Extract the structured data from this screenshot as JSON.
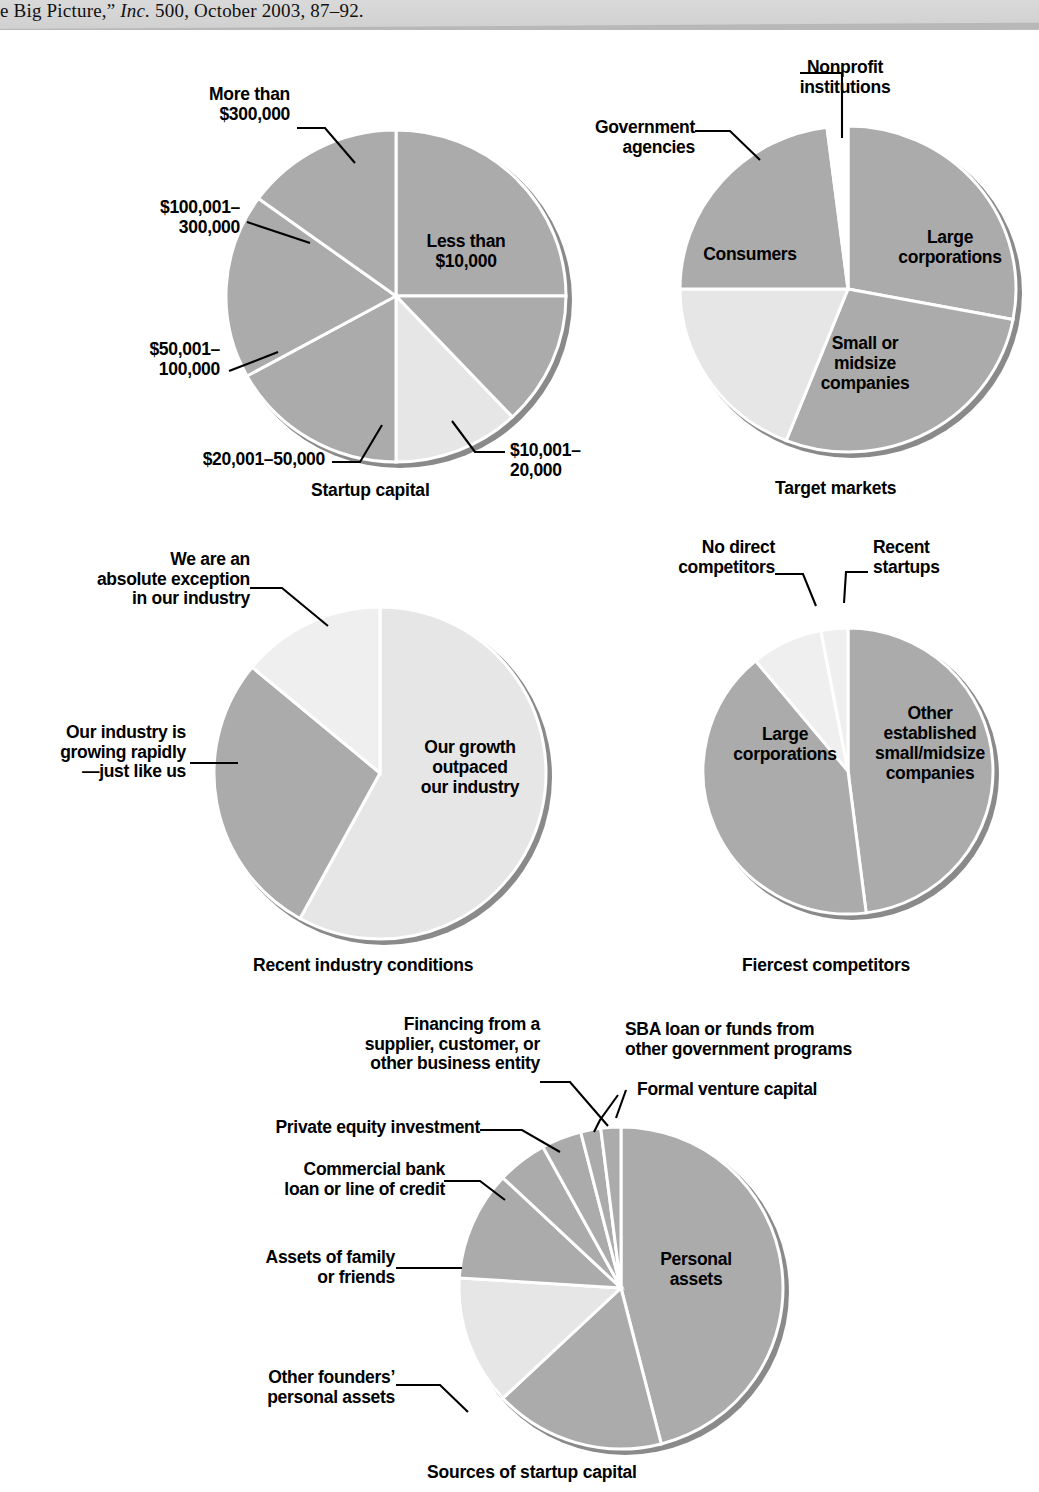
{
  "header": {
    "citation_prefix": "e Big Picture,” ",
    "citation_italic": "Inc.",
    "citation_suffix": " 500, October 2003, 87–92."
  },
  "colors": {
    "slice_mid": "#ababab",
    "slice_light": "#e6e6e6",
    "slice_lighter": "#efefef",
    "slice_dark": "#9d9d9d",
    "edge": "#ffffff",
    "shadow": "#808080",
    "text": "#000000"
  },
  "chart_data": [
    {
      "id": "startup-capital",
      "type": "pie",
      "title": "Startup capital",
      "labels": [
        "Less than\n$10,000",
        "$10,001–\n20,000",
        "$20,001–50,000",
        "$50,001–\n100,000",
        "$100,001–\n300,000",
        "More than\n$300,000"
      ],
      "categories": [
        "Less than $10,000",
        "$10,001–20,000",
        "$20,001–50,000",
        "$50,001–100,000",
        "$100,001–300,000",
        "More than $300,000"
      ],
      "values": [
        25,
        13,
        12,
        17,
        18,
        15
      ],
      "legend": "none",
      "grid": false
    },
    {
      "id": "target-markets",
      "type": "pie",
      "title": "Target markets",
      "labels": [
        "Large\ncorporations",
        "Small or\nmidsize\ncompanies",
        "Consumers",
        "Government\nagencies",
        "Nonprofit\ninstitutions"
      ],
      "categories": [
        "Large corporations",
        "Small or midsize companies",
        "Consumers",
        "Government agencies",
        "Nonprofit institutions"
      ],
      "values": [
        28,
        28,
        19,
        23,
        2
      ],
      "legend": "none",
      "grid": false
    },
    {
      "id": "recent-industry-conditions",
      "type": "pie",
      "title": "Recent industry conditions",
      "labels": [
        "Our growth\noutpaced\nour industry",
        "Our industry is\ngrowing rapidly\n—just like us",
        "We are an\nabsolute exception\nin our industry"
      ],
      "categories": [
        "Our growth outpaced our industry",
        "Our industry is growing rapidly—just like us",
        "We are an absolute exception in our industry"
      ],
      "values": [
        58,
        28,
        14
      ],
      "legend": "none",
      "grid": false
    },
    {
      "id": "fiercest-competitors",
      "type": "pie",
      "title": "Fiercest competitors",
      "labels": [
        "Other\nestablished\nsmall/midsize\ncompanies",
        "Large\ncorporations",
        "No direct\ncompetitors",
        "Recent\nstartups"
      ],
      "categories": [
        "Other established small/midsize companies",
        "Large corporations",
        "No direct competitors",
        "Recent startups"
      ],
      "values": [
        48,
        41,
        8,
        3
      ],
      "legend": "none",
      "grid": false
    },
    {
      "id": "sources-of-startup-capital",
      "type": "pie",
      "title": "Sources of startup capital",
      "labels": [
        "Personal\nassets",
        "Other founders’\npersonal assets",
        "Assets of family\nor friends",
        "Commercial bank\nloan or line of credit",
        "Private equity investment",
        "Financing from a\nsupplier, customer,  or\nother business entity",
        "SBA loan or funds from\nother government programs",
        "Formal venture capital"
      ],
      "categories": [
        "Personal assets",
        "Other founders’ personal assets",
        "Assets of family or friends",
        "Commercial bank loan or line of credit",
        "Private equity investment",
        "Financing from a supplier, customer, or other business entity",
        "SBA loan or funds from other government programs",
        "Formal venture capital"
      ],
      "values": [
        46,
        17,
        13,
        11,
        5,
        4,
        2,
        2
      ],
      "legend": "none",
      "grid": false
    }
  ]
}
